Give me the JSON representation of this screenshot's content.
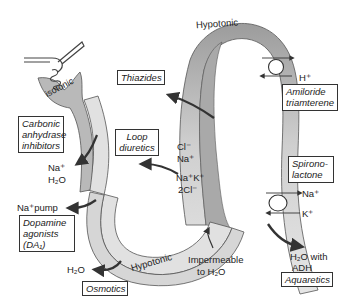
{
  "diagram": {
    "colors": {
      "tubule_light": "#dcdcdc",
      "tubule_mid": "#bdbdbd",
      "tubule_dark": "#8e8e8e",
      "outline": "#555555",
      "arrow": "#333333",
      "text": "#222222"
    },
    "segment_labels": {
      "isotonic": "Isotonic",
      "hypotonic_top": "Hypotonic",
      "hypotonic_bottom": "Hypotonic",
      "impermeable_line1": "Impermeable",
      "impermeable_line2": "to H₂O"
    },
    "ions": {
      "pt_na": "Na⁺",
      "pt_h2o": "H₂O",
      "na_pump": "Na⁺pump",
      "dct_cl": "Cl⁻",
      "dct_na": "Na⁺",
      "loop_nak": "Na⁺K⁺",
      "loop_2cl": "2Cl⁻",
      "cd_h": "H⁺",
      "cd_na": "Na⁺",
      "cd_k": "K⁺",
      "cd_h2o_line1": "H₂O with",
      "cd_h2o_line2": "ADH",
      "desc_h2o": "H₂O"
    },
    "drug_boxes": {
      "thiazides": "Thiazides",
      "carbonic_line1": "Carbonic",
      "carbonic_line2": "anhydrase",
      "carbonic_line3": "inhibitors",
      "loop_line1": "Loop",
      "loop_line2": "diuretics",
      "dopamine_line1": "Dopamine",
      "dopamine_line2": "agonists",
      "dopamine_line3": "(DA₁)",
      "osmotics": "Osmotics",
      "amiloride_line1": "Amiloride",
      "amiloride_line2": "triamterene",
      "spirono_line1": "Spirono-",
      "spirono_line2": "lactone",
      "aquaretics": "Aquaretics"
    }
  }
}
